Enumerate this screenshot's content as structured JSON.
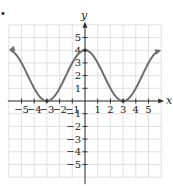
{
  "chart_data": {
    "type": "line",
    "title": "",
    "xlabel": "x",
    "ylabel": "y",
    "xlim": [
      -6,
      6
    ],
    "ylim": [
      -6,
      6
    ],
    "grid": true,
    "x_ticks": [
      -5,
      -4,
      -3,
      -2,
      -1,
      1,
      2,
      3,
      4,
      5
    ],
    "y_ticks": [
      -5,
      -4,
      -3,
      -2,
      -1,
      1,
      2,
      3,
      4,
      5
    ],
    "x_tick_labels": [
      "−5",
      "−4",
      "−3",
      "−2",
      "−1",
      "1",
      "2",
      "3",
      "4",
      "5"
    ],
    "y_tick_labels": [
      "−5",
      "−4",
      "−3",
      "−2",
      "−1",
      "1",
      "2",
      "3",
      "4",
      "5"
    ],
    "series": [
      {
        "name": "f(x)",
        "description": "smooth curve with maximum at (0,4), minima at (-3,0) and (3,0), arrows at both ends",
        "x": [
          -6,
          -5,
          -4,
          -3,
          -2,
          -1,
          0,
          1,
          2,
          3,
          4,
          5,
          6
        ],
        "y": [
          4,
          3,
          1,
          0,
          1,
          3,
          4,
          3,
          1,
          0,
          1,
          3,
          4
        ],
        "key_points": [
          [
            -3,
            0
          ],
          [
            0,
            4
          ],
          [
            3,
            0
          ]
        ],
        "end_arrows": true
      }
    ],
    "legend": null
  },
  "colors": {
    "curve": "#6e6e6e",
    "axes": "#333333",
    "grid": "#d9d9d9",
    "background": "#ffffff"
  },
  "layout": {
    "origin_px": [
      85,
      101
    ],
    "unit_px": 12.7
  },
  "marker": "•"
}
